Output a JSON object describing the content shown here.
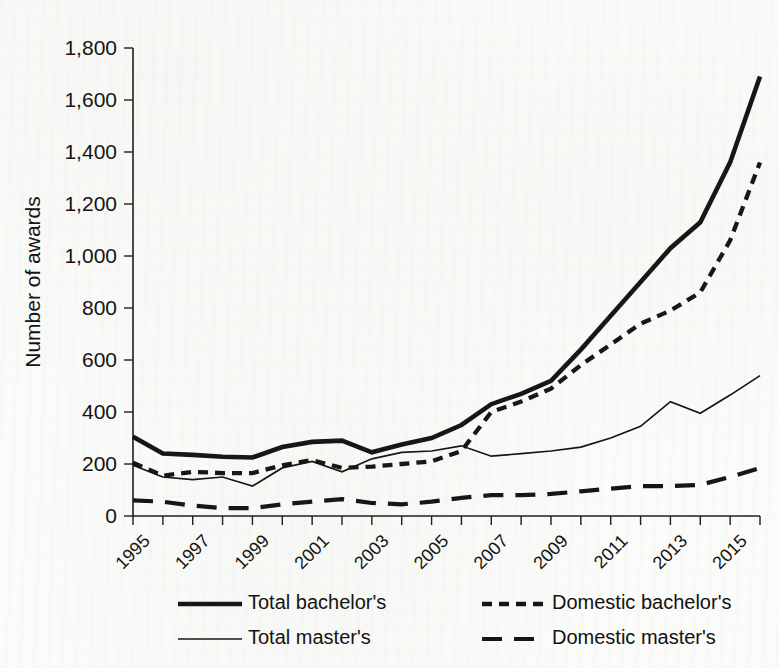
{
  "chart_data": {
    "type": "line",
    "title": "",
    "xlabel": "",
    "ylabel": "Number of awards",
    "ylim": [
      0,
      1800
    ],
    "ytick_values": [
      0,
      200,
      400,
      600,
      800,
      1000,
      1200,
      1400,
      1600,
      1800
    ],
    "ytick_labels": [
      "0",
      "200",
      "400",
      "600",
      "800",
      "1,000",
      "1,200",
      "1,400",
      "1,600",
      "1,800"
    ],
    "grid": false,
    "legend_position": "bottom",
    "xlim": [
      1995,
      2016
    ],
    "x": [
      1995,
      1996,
      1997,
      1998,
      1999,
      2000,
      2001,
      2002,
      2003,
      2004,
      2005,
      2006,
      2007,
      2008,
      2009,
      2010,
      2011,
      2012,
      2013,
      2014,
      2015,
      2016
    ],
    "xtick_labels": [
      "1995",
      "1997",
      "1999",
      "2001",
      "2003",
      "2005",
      "2007",
      "2009",
      "2011",
      "2013",
      "2015"
    ],
    "xtick_label_years": [
      1995,
      1997,
      1999,
      2001,
      2003,
      2005,
      2007,
      2009,
      2011,
      2013,
      2015
    ],
    "series": [
      {
        "name": "Total bachelor's",
        "style": "thick-solid",
        "values": [
          305,
          240,
          235,
          228,
          225,
          265,
          285,
          290,
          245,
          275,
          300,
          350,
          430,
          470,
          520,
          640,
          770,
          900,
          1030,
          1130,
          1360,
          1690
        ]
      },
      {
        "name": "Domestic bachelor's",
        "style": "short-dash",
        "values": [
          205,
          155,
          170,
          165,
          165,
          195,
          215,
          185,
          190,
          200,
          210,
          250,
          400,
          440,
          490,
          580,
          660,
          740,
          790,
          860,
          1060,
          1360
        ]
      },
      {
        "name": "Total master's",
        "style": "thin-solid",
        "values": [
          195,
          150,
          140,
          150,
          115,
          185,
          210,
          170,
          220,
          245,
          250,
          270,
          230,
          240,
          250,
          265,
          300,
          345,
          440,
          395,
          465,
          540
        ]
      },
      {
        "name": "Domestic master's",
        "style": "long-dash",
        "values": [
          60,
          55,
          40,
          30,
          30,
          45,
          55,
          65,
          50,
          45,
          55,
          70,
          80,
          80,
          85,
          95,
          105,
          115,
          115,
          120,
          150,
          185
        ]
      }
    ]
  },
  "legend": {
    "items": [
      {
        "label": "Total bachelor's",
        "style": "thick-solid"
      },
      {
        "label": "Domestic bachelor's",
        "style": "short-dash"
      },
      {
        "label": "Total master's",
        "style": "thin-solid"
      },
      {
        "label": "Domestic master's",
        "style": "long-dash"
      }
    ]
  },
  "colors": {
    "ink": "#141414",
    "paper": "#fbfbf9"
  }
}
